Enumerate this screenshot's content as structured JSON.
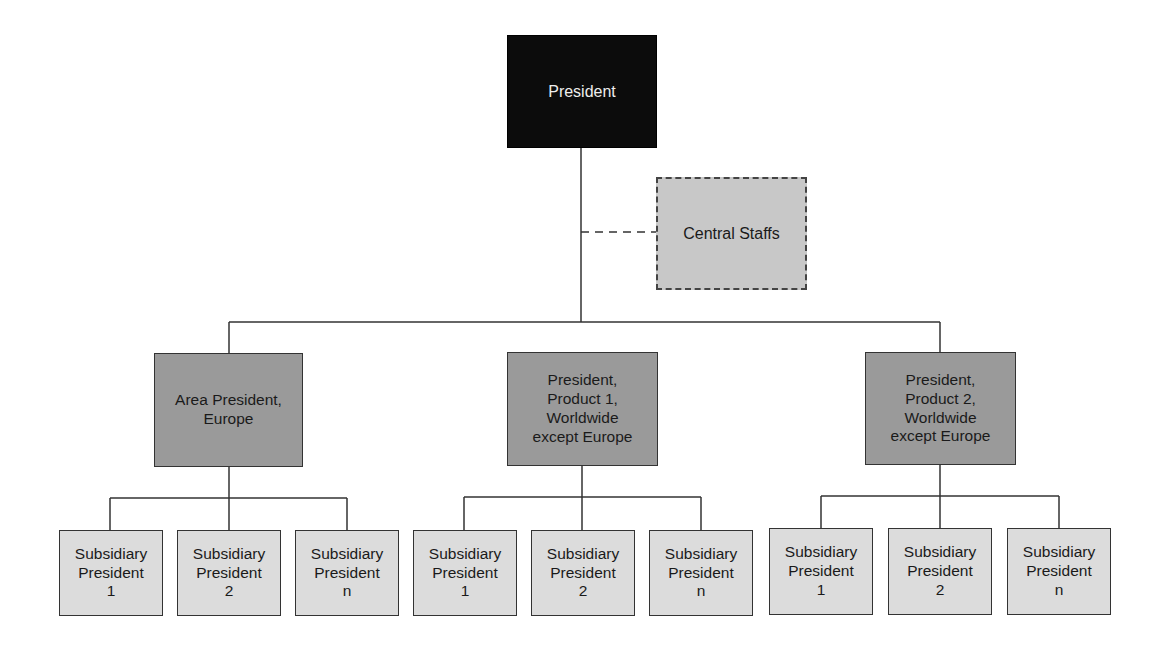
{
  "diagram": {
    "type": "org-chart",
    "top": {
      "label": "President",
      "color": "#0c0c0c"
    },
    "staff": {
      "label": "Central Staffs",
      "color": "#c8c8c8",
      "link": "dashed"
    },
    "divisions": [
      {
        "label": "Area President,\nEurope",
        "subs": [
          "Subsidiary\nPresident\n1",
          "Subsidiary\nPresident\n2",
          "Subsidiary\nPresident\nn"
        ]
      },
      {
        "label": "President,\nProduct 1,\nWorldwide\nexcept Europe",
        "subs": [
          "Subsidiary\nPresident\n1",
          "Subsidiary\nPresident\n2",
          "Subsidiary\nPresident\nn"
        ]
      },
      {
        "label": "President,\nProduct 2,\nWorldwide\nexcept Europe",
        "subs": [
          "Subsidiary\nPresident\n1",
          "Subsidiary\nPresident\n2",
          "Subsidiary\nPresident\nn"
        ]
      }
    ],
    "colors": {
      "division": "#9a9a9a",
      "subsidiary": "#dcdcdc",
      "line": "#333333"
    }
  }
}
